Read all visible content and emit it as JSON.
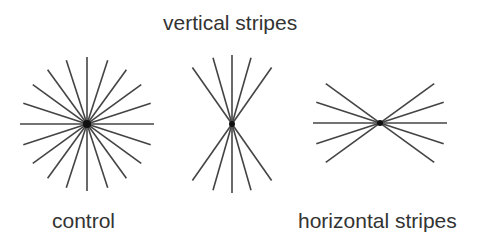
{
  "labels": {
    "top": "vertical stripes",
    "bottom_left": "control",
    "bottom_right": "horizontal stripes"
  },
  "style": {
    "line_color": "#444444",
    "text_color": "#333333",
    "center_color": "#111111",
    "background": "#ffffff"
  },
  "figures": [
    {
      "id": "control",
      "center": [
        87,
        124
      ],
      "radius": 67,
      "angles_deg": [
        0,
        18,
        36,
        54,
        72,
        90,
        108,
        126,
        144,
        162
      ]
    },
    {
      "id": "vertical-stripes",
      "center": [
        232,
        124
      ],
      "radius": 69,
      "angles_deg": [
        90,
        74,
        106,
        55,
        125
      ]
    },
    {
      "id": "horizontal-stripes",
      "center": [
        380,
        123
      ],
      "radius": 67,
      "angles_deg": [
        0,
        18,
        -18,
        36,
        -36
      ]
    }
  ]
}
